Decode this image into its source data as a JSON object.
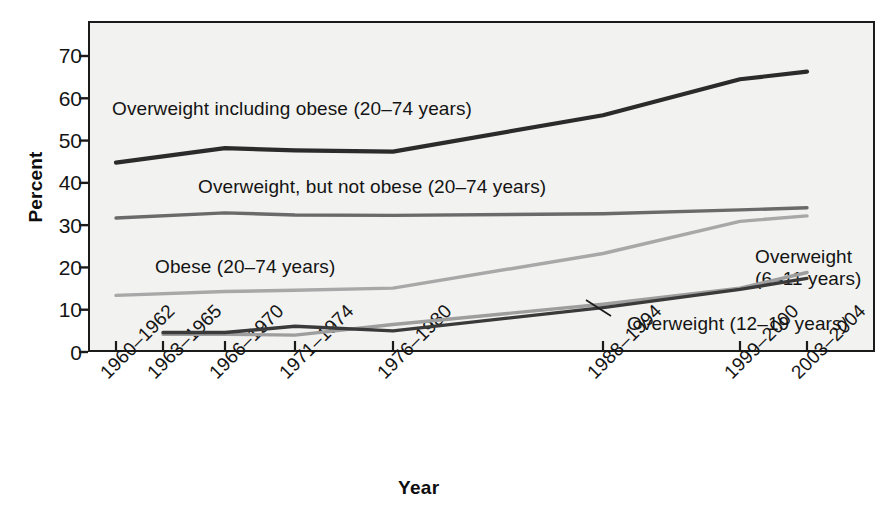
{
  "chart_data": {
    "type": "line",
    "title": "",
    "xlabel": "Year",
    "ylabel": "Percent",
    "ylim": [
      0,
      75
    ],
    "yticks": [
      0,
      10,
      20,
      30,
      40,
      50,
      60,
      70
    ],
    "grid": false,
    "legend_position": "inline-annotations",
    "categories": [
      "1960–1962",
      "1963–1965",
      "1966–1970",
      "1971–1974",
      "1976–1980",
      "1988–1994",
      "1999–2000",
      "2003–2004"
    ],
    "series": [
      {
        "name": "Overweight including obese (20–74 years)",
        "color": "#2b2b2b",
        "x": [
          "1960–1962",
          "1966–1970",
          "1971–1974",
          "1976–1980",
          "1988–1994",
          "1999–2000",
          "2003–2004"
        ],
        "values": [
          44.8,
          48.2,
          47.7,
          47.4,
          56.0,
          64.5,
          66.3
        ]
      },
      {
        "name": "Overweight, but not obese (20–74 years)",
        "color": "#6a6a6a",
        "x": [
          "1960–1962",
          "1966–1970",
          "1971–1974",
          "1976–1980",
          "1988–1994",
          "1999–2000",
          "2003–2004"
        ],
        "values": [
          31.7,
          32.9,
          32.4,
          32.3,
          32.7,
          33.6,
          34.1
        ]
      },
      {
        "name": "Obese (20–74 years)",
        "color": "#a8a8a8",
        "x": [
          "1960–1962",
          "1966–1970",
          "1971–1974",
          "1976–1980",
          "1988–1994",
          "1999–2000",
          "2003–2004"
        ],
        "values": [
          13.4,
          14.3,
          14.6,
          15.1,
          23.3,
          30.9,
          32.2
        ]
      },
      {
        "name": "Overweight (6–11 years)",
        "color": "#9e9e9e",
        "x": [
          "1963–1965",
          "1966–1970",
          "1971–1974",
          "1976–1980",
          "1988–1994",
          "1999–2000",
          "2003–2004"
        ],
        "values": [
          4.2,
          4.2,
          4.0,
          6.5,
          11.3,
          15.1,
          18.8
        ]
      },
      {
        "name": "Overweight (12–19 years)",
        "color": "#3a3a3a",
        "x": [
          "1963–1965",
          "1966–1970",
          "1971–1974",
          "1976–1980",
          "1988–1994",
          "1999–2000",
          "2003–2004"
        ],
        "values": [
          4.6,
          4.6,
          6.1,
          5.0,
          10.5,
          14.8,
          17.4
        ]
      }
    ],
    "annotations": [
      {
        "id": "ann-overweight-including-obese",
        "text": "Overweight including obese (20–74 years)",
        "x": 112,
        "y": 97
      },
      {
        "id": "ann-overweight-not-obese",
        "text": "Overweight, but not obese (20–74 years)",
        "x": 198,
        "y": 175
      },
      {
        "id": "ann-obese",
        "text": "Obese (20–74 years)",
        "x": 155,
        "y": 255
      },
      {
        "id": "ann-overweight-6-11-line1",
        "text": "Overweight",
        "x": 755,
        "y": 245
      },
      {
        "id": "ann-overweight-6-11-line2",
        "text": "(6–11 years)",
        "x": 755,
        "y": 267
      },
      {
        "id": "ann-overweight-12-19",
        "text": "Overweight (12–19 years)",
        "x": 627,
        "y": 312
      }
    ]
  },
  "axes": {
    "y_title": "Percent",
    "x_title": "Year",
    "y_tick_labels": [
      "70",
      "60",
      "50",
      "40",
      "30",
      "20",
      "10",
      "0"
    ],
    "x_tick_labels": [
      "1960–1962",
      "1963–1965",
      "1966–1970",
      "1971–1974",
      "1976–1980",
      "1988–1994",
      "1999–2000",
      "2003–2004"
    ]
  },
  "colors": {
    "plot_background": "#f2f2f0",
    "frame": "#1b1b1b",
    "series_dark": "#2b2b2b",
    "series_mid": "#6a6a6a",
    "series_light": "#a8a8a8"
  }
}
